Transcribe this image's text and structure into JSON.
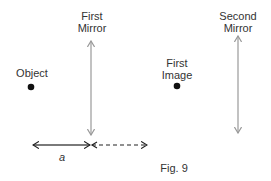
{
  "labels": {
    "first_mirror": [
      "First",
      "Mirror"
    ],
    "second_mirror": [
      "Second",
      "Mirror"
    ],
    "object": "Object",
    "first_image": [
      "First",
      "Image"
    ],
    "distance": "a",
    "caption": "Fig. 9"
  },
  "colors": {
    "mirror": "#999999",
    "dot": "#111111",
    "arrow": "#222222"
  }
}
